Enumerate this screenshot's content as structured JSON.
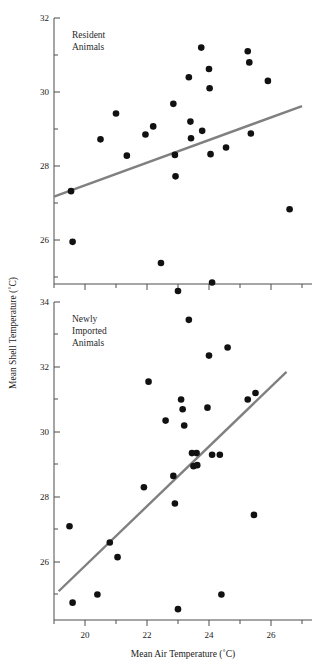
{
  "chart_data": {
    "type": "scatter",
    "title": "",
    "xlabel": "Mean Air Temperature (˚C)",
    "ylabel": "Mean Shell Temperature (˚C)",
    "grid": false,
    "legend": "none",
    "shared_x": {
      "label": "Mean Air Temperature (˚C)",
      "ticks": [
        20,
        22,
        24,
        26
      ],
      "tick_labels": [
        "20",
        "22",
        "24",
        "26"
      ],
      "minor_ticks": [
        19.5,
        20.5,
        21.5,
        22.5,
        23.5,
        24.5,
        25.5,
        26.5
      ],
      "xlim": [
        18.95,
        27.05
      ]
    },
    "panels": [
      {
        "id": "resident",
        "label": "Resident\nAnimals",
        "label_line1": "Resident",
        "label_line2": "Animals",
        "ylim": [
          24.4,
          32.0
        ],
        "yticks": [
          26,
          28,
          30,
          32
        ],
        "ytick_labels": [
          "26",
          "28",
          "30",
          "32"
        ],
        "yminor_ticks": [
          25,
          27,
          29,
          31
        ],
        "points": [
          {
            "x": 19.55,
            "y": 27.32
          },
          {
            "x": 19.6,
            "y": 25.95
          },
          {
            "x": 20.5,
            "y": 28.72
          },
          {
            "x": 21.0,
            "y": 29.42
          },
          {
            "x": 21.35,
            "y": 28.28
          },
          {
            "x": 21.95,
            "y": 28.85
          },
          {
            "x": 22.2,
            "y": 29.07
          },
          {
            "x": 22.45,
            "y": 25.38
          },
          {
            "x": 22.85,
            "y": 29.68
          },
          {
            "x": 22.9,
            "y": 28.3
          },
          {
            "x": 22.92,
            "y": 27.72
          },
          {
            "x": 23.0,
            "y": 24.62
          },
          {
            "x": 23.35,
            "y": 30.4
          },
          {
            "x": 23.4,
            "y": 29.2
          },
          {
            "x": 23.42,
            "y": 28.75
          },
          {
            "x": 23.75,
            "y": 31.2
          },
          {
            "x": 23.78,
            "y": 28.95
          },
          {
            "x": 24.0,
            "y": 30.62
          },
          {
            "x": 24.02,
            "y": 30.1
          },
          {
            "x": 24.05,
            "y": 28.32
          },
          {
            "x": 24.1,
            "y": 24.85
          },
          {
            "x": 24.55,
            "y": 28.5
          },
          {
            "x": 25.25,
            "y": 31.1
          },
          {
            "x": 25.3,
            "y": 30.8
          },
          {
            "x": 25.35,
            "y": 28.88
          },
          {
            "x": 25.9,
            "y": 30.3
          },
          {
            "x": 26.6,
            "y": 26.83
          }
        ],
        "fit_line": {
          "x1": 19.0,
          "y1": 27.17,
          "x2": 27.0,
          "y2": 29.62
        }
      },
      {
        "id": "newly-imported",
        "label": "Newly\nImported\nAnimals",
        "label_line1": "Newly",
        "label_line2": "Imported",
        "label_line3": "Animals",
        "ylim": [
          24.45,
          34.1
        ],
        "yticks": [
          26,
          28,
          30,
          32,
          34
        ],
        "ytick_labels": [
          "26",
          "28",
          "30",
          "32",
          "34"
        ],
        "yminor_ticks": [
          25,
          27,
          29,
          31,
          33
        ],
        "points": [
          {
            "x": 19.5,
            "y": 27.1
          },
          {
            "x": 19.6,
            "y": 24.75
          },
          {
            "x": 20.4,
            "y": 25.0
          },
          {
            "x": 20.8,
            "y": 26.6
          },
          {
            "x": 21.05,
            "y": 26.15
          },
          {
            "x": 21.9,
            "y": 28.3
          },
          {
            "x": 22.05,
            "y": 31.55
          },
          {
            "x": 22.6,
            "y": 30.35
          },
          {
            "x": 22.85,
            "y": 28.65
          },
          {
            "x": 22.9,
            "y": 27.8
          },
          {
            "x": 23.0,
            "y": 24.55
          },
          {
            "x": 23.1,
            "y": 31.0
          },
          {
            "x": 23.15,
            "y": 30.7
          },
          {
            "x": 23.2,
            "y": 30.2
          },
          {
            "x": 23.35,
            "y": 33.45
          },
          {
            "x": 23.45,
            "y": 29.35
          },
          {
            "x": 23.5,
            "y": 28.95
          },
          {
            "x": 23.6,
            "y": 29.35
          },
          {
            "x": 23.62,
            "y": 28.98
          },
          {
            "x": 23.95,
            "y": 30.75
          },
          {
            "x": 24.0,
            "y": 32.35
          },
          {
            "x": 24.1,
            "y": 29.3
          },
          {
            "x": 24.35,
            "y": 29.3
          },
          {
            "x": 24.4,
            "y": 25.0
          },
          {
            "x": 24.6,
            "y": 32.6
          },
          {
            "x": 25.25,
            "y": 31.0
          },
          {
            "x": 25.45,
            "y": 27.45
          },
          {
            "x": 25.5,
            "y": 31.2
          }
        ],
        "fit_line": {
          "x1": 19.15,
          "y1": 25.1,
          "x2": 26.5,
          "y2": 31.85
        }
      }
    ]
  },
  "figure": {
    "point_radius": 3.3,
    "point_color": "#111111",
    "line_color": "#808080",
    "axis_color": "#4d4d4d"
  }
}
